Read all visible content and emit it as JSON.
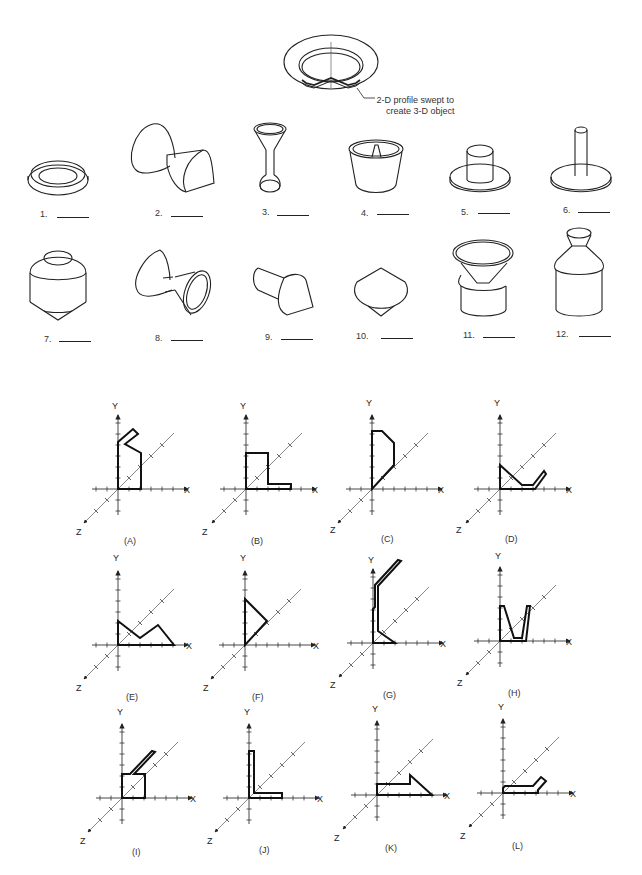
{
  "header_figure": {
    "callout": [
      "2-D profile swept to",
      "create 3-D object"
    ]
  },
  "objects": [
    {
      "num": "1.",
      "blank": ""
    },
    {
      "num": "2.",
      "blank": ""
    },
    {
      "num": "3.",
      "blank": ""
    },
    {
      "num": "4.",
      "blank": ""
    },
    {
      "num": "5.",
      "blank": ""
    },
    {
      "num": "6.",
      "blank": ""
    },
    {
      "num": "7.",
      "blank": ""
    },
    {
      "num": "8.",
      "blank": ""
    },
    {
      "num": "9.",
      "blank": ""
    },
    {
      "num": "10.",
      "blank": ""
    },
    {
      "num": "11.",
      "blank": ""
    },
    {
      "num": "12.",
      "blank": ""
    }
  ],
  "axes": {
    "x": "X",
    "y": "Y",
    "z": "Z"
  },
  "profiles": [
    {
      "caption": "(A)"
    },
    {
      "caption": "(B)"
    },
    {
      "caption": "(C)"
    },
    {
      "caption": "(D)"
    },
    {
      "caption": "(E)"
    },
    {
      "caption": "(F)"
    },
    {
      "caption": "(G)"
    },
    {
      "caption": "(H)"
    },
    {
      "caption": "(I)"
    },
    {
      "caption": "(J)"
    },
    {
      "caption": "(K)"
    },
    {
      "caption": "(L)"
    }
  ]
}
